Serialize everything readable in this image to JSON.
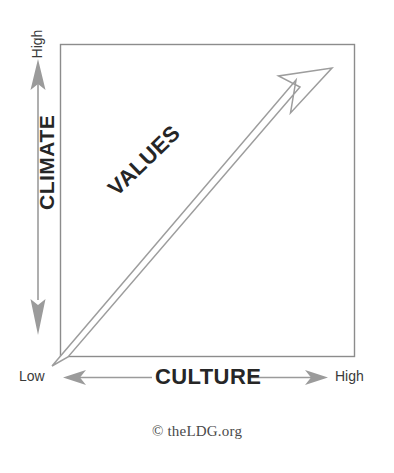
{
  "diagram": {
    "title_alt": "Culture / Climate / Values matrix",
    "frame": {
      "x": 60,
      "y": 44,
      "width": 295,
      "height": 313,
      "stroke": "#8c8c8c"
    },
    "y_axis": {
      "label": "CLIMATE",
      "high_label": "High",
      "low_label": "",
      "arrow_color": "#8a8a8a",
      "direction": "double"
    },
    "x_axis": {
      "label": "CULTURE",
      "low_label": "Low",
      "high_label": "High",
      "arrow_color": "#8a8a8a",
      "direction": "double"
    },
    "diagonal": {
      "label": "VALUES",
      "outline_color": "#9a9a9a",
      "fill": "none",
      "from": "low-culture-low-climate",
      "to": "high-culture-high-climate",
      "rotation_deg": -44
    },
    "credit": "© theLDG.org",
    "colors": {
      "ink": "#262626",
      "line": "#8c8c8c",
      "arrow": "#8a8a8a",
      "background": "#ffffff"
    }
  }
}
